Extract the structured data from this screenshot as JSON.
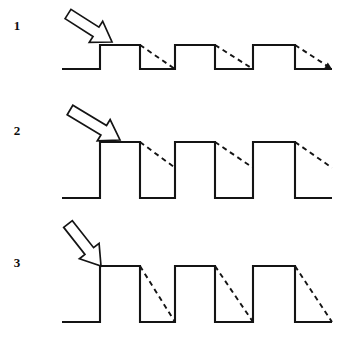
{
  "figure": {
    "width": 341,
    "height": 340,
    "background_color": "#ffffff",
    "ink_color": "#141414"
  },
  "panels": [
    {
      "label": "1",
      "label_x": 17,
      "label_y": 30,
      "baseline_y": 69,
      "top_y": 45,
      "x_start": 62,
      "x_end": 332,
      "edges": [
        100,
        140,
        175,
        215,
        253,
        295
      ],
      "decay_end_fraction": 1.0,
      "tail_arrow": true,
      "arrow": {
        "tip_x": 112,
        "tip_y": 42,
        "tail_x": 68,
        "tail_y": 14,
        "angle_deg": 40,
        "length": 52,
        "shaft_half_width": 5.5,
        "head_half_width": 12.5,
        "head_length": 19
      }
    },
    {
      "label": "2",
      "label_x": 17,
      "label_y": 135,
      "baseline_y": 198,
      "top_y": 142,
      "x_start": 62,
      "x_end": 332,
      "edges": [
        100,
        140,
        175,
        215,
        253,
        295
      ],
      "decay_end_fraction": 0.46,
      "tail_arrow": false,
      "arrow": {
        "tip_x": 120,
        "tip_y": 140,
        "tail_x": 70,
        "tail_y": 110,
        "angle_deg": 41,
        "length": 58,
        "shaft_half_width": 5.5,
        "head_half_width": 12.5,
        "head_length": 19
      }
    },
    {
      "label": "3",
      "label_x": 17,
      "label_y": 267,
      "baseline_y": 322,
      "top_y": 266,
      "x_start": 62,
      "x_end": 332,
      "edges": [
        100,
        140,
        175,
        215,
        253,
        295
      ],
      "decay_end_fraction": 1.0,
      "tail_arrow": false,
      "arrow": {
        "tip_x": 101,
        "tip_y": 266,
        "tail_x": 68,
        "tail_y": 224,
        "angle_deg": 52,
        "length": 54,
        "shaft_half_width": 5.5,
        "head_half_width": 12.5,
        "head_length": 19
      }
    }
  ]
}
